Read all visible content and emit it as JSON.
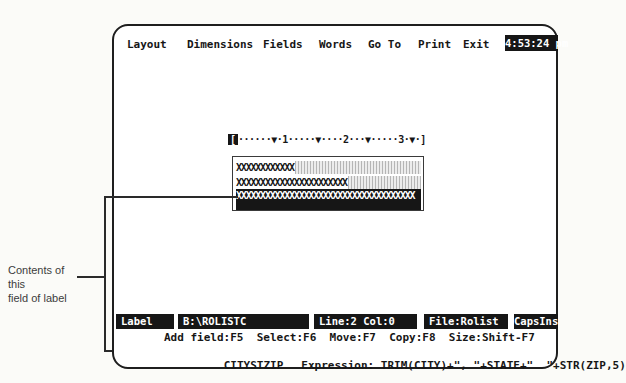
{
  "annotation": {
    "line1": "Contents of this",
    "line2": "field of label"
  },
  "menu_bar": {
    "items": [
      "Layout",
      "Dimensions",
      "Fields",
      "Words",
      "Go To",
      "Print",
      "Exit"
    ],
    "clock": "4:53:24 pm"
  },
  "ruler": {
    "left_bracket": "[",
    "body": "······▼·1·····▼····2···▼·····3·▼·]"
  },
  "label_design": {
    "row1_field": "XXXXXXXXXXXX",
    "row2_field": "XXXXXXXXXXXXXXXXXXXXXXX",
    "row3_field": "XXXXXXXXXXXXXXXXXXXXXXXXXXXXXXXXXXXXX"
  },
  "status_bar": {
    "mode": "Label",
    "path": "B:\\ROLISTC",
    "position": "Line:2 Col:0",
    "file": "File:Rolist",
    "indicators": "CapsIns"
  },
  "nav_line": "Add field:F5  Select:F6  Move:F7  Copy:F8  Size:Shift-F7",
  "expression_line": {
    "field_name": "CITYSTZIP",
    "expression": "Expression: TRIM(CITY)+\", \"+STATE+\"  \"+STR(ZIP,5)"
  },
  "colors": {
    "screen_fg": "#161616",
    "screen_bg": "#ffffff",
    "inverse_bg": "#161616",
    "inverse_fg": "#ffffff"
  }
}
